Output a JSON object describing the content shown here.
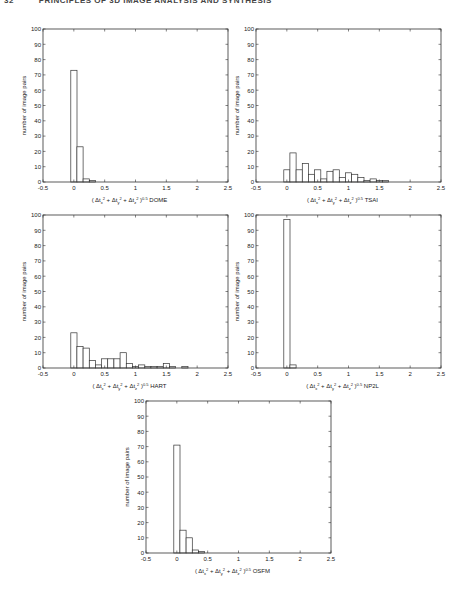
{
  "header": {
    "page_number": "32",
    "running_title": "PRINCIPLES OF 3D IMAGE ANALYSIS AND SYNTHESIS"
  },
  "chart_data": [
    {
      "type": "bar",
      "id": "dome",
      "title": "",
      "xlabel": "( Δt_x² + Δt_y² + Δt_z² )^0.5  DOME",
      "xlabel_parts": {
        "open": "( Δt",
        "x": "x",
        "y": "y",
        "z": "z",
        "close_exp": "0.5",
        "method": "DOME"
      },
      "ylabel": "number of image pairs",
      "xlim": [
        -0.5,
        2.5
      ],
      "ylim": [
        0,
        100
      ],
      "xticks": [
        "-0.5",
        "0",
        "0.5",
        "1",
        "1.5",
        "2",
        "2.5"
      ],
      "yticks": [
        "0",
        "10",
        "20",
        "30",
        "40",
        "50",
        "60",
        "70",
        "80",
        "90",
        "100"
      ],
      "bin_width": 0.1,
      "bin_centers": [
        0,
        0.1,
        0.2,
        0.3
      ],
      "values": [
        73,
        23,
        2,
        1
      ],
      "box": {
        "x": 43,
        "y": 29,
        "w": 185,
        "h": 153
      }
    },
    {
      "type": "bar",
      "id": "tsai",
      "title": "",
      "xlabel": "( Δt_x² + Δt_y² + Δt_z² )^0.5  TSAI",
      "xlabel_parts": {
        "method": "TSAI"
      },
      "ylabel": "number of image pairs",
      "xlim": [
        -0.5,
        2.5
      ],
      "ylim": [
        0,
        100
      ],
      "xticks": [
        "-0.5",
        "0",
        "0.5",
        "1",
        "1.5",
        "2",
        "2.5"
      ],
      "yticks": [
        "0",
        "10",
        "20",
        "30",
        "40",
        "50",
        "60",
        "70",
        "80",
        "90",
        "100"
      ],
      "bin_width": 0.1,
      "bin_centers": [
        0,
        0.1,
        0.2,
        0.3,
        0.4,
        0.5,
        0.6,
        0.7,
        0.8,
        0.9,
        1.0,
        1.1,
        1.2,
        1.3,
        1.4,
        1.5,
        1.6
      ],
      "values": [
        8,
        19,
        8,
        12,
        5,
        8,
        2,
        7,
        8,
        3,
        6,
        5,
        3,
        1,
        2,
        1,
        1
      ],
      "box": {
        "x": 256,
        "y": 29,
        "w": 185,
        "h": 153
      }
    },
    {
      "type": "bar",
      "id": "hart",
      "title": "",
      "xlabel": "( Δt_x² + Δt_y² + Δt_z² )^0.5  HART",
      "xlabel_parts": {
        "method": "HART"
      },
      "ylabel": "number of image pairs",
      "xlim": [
        -0.5,
        2.5
      ],
      "ylim": [
        0,
        100
      ],
      "xticks": [
        "-0.5",
        "0",
        "0.5",
        "1",
        "1.5",
        "2",
        "2.5"
      ],
      "yticks": [
        "0",
        "10",
        "20",
        "30",
        "40",
        "50",
        "60",
        "70",
        "80",
        "90",
        "100"
      ],
      "bin_width": 0.1,
      "bin_centers": [
        0,
        0.1,
        0.2,
        0.3,
        0.4,
        0.5,
        0.6,
        0.7,
        0.8,
        0.9,
        1.0,
        1.1,
        1.2,
        1.3,
        1.4,
        1.5,
        1.6,
        1.7,
        1.8
      ],
      "values": [
        23,
        14,
        13,
        5,
        2,
        6,
        6,
        6,
        10,
        3,
        1,
        2,
        1,
        1,
        1,
        3,
        1,
        0,
        1
      ],
      "box": {
        "x": 43,
        "y": 215,
        "w": 185,
        "h": 153
      }
    },
    {
      "type": "bar",
      "id": "np2l",
      "title": "",
      "xlabel": "( Δt_x² + Δt_y² + Δt_z² )^0.5  NP2L",
      "xlabel_parts": {
        "method": "NP2L"
      },
      "ylabel": "number of image pairs",
      "xlim": [
        -0.5,
        2.5
      ],
      "ylim": [
        0,
        100
      ],
      "xticks": [
        "-0.5",
        "0",
        "0.5",
        "1",
        "1.5",
        "2",
        "2.5"
      ],
      "yticks": [
        "0",
        "10",
        "20",
        "30",
        "40",
        "50",
        "60",
        "70",
        "80",
        "90",
        "100"
      ],
      "bin_width": 0.1,
      "bin_centers": [
        0,
        0.1
      ],
      "values": [
        97,
        2
      ],
      "box": {
        "x": 256,
        "y": 215,
        "w": 185,
        "h": 153
      }
    },
    {
      "type": "bar",
      "id": "osfm",
      "title": "",
      "xlabel": "( Δt_x² + Δt_y² + Δt_z² )^0.5  OSFM",
      "xlabel_parts": {
        "method": "OSFM"
      },
      "ylabel": "number of image pairs",
      "xlim": [
        -0.5,
        2.5
      ],
      "ylim": [
        0,
        100
      ],
      "xticks": [
        "-0.5",
        "0",
        "0.5",
        "1",
        "1.5",
        "2",
        "2.5"
      ],
      "yticks": [
        "0",
        "10",
        "20",
        "30",
        "40",
        "50",
        "60",
        "70",
        "80",
        "90",
        "100"
      ],
      "bin_width": 0.1,
      "bin_centers": [
        0,
        0.1,
        0.2,
        0.3,
        0.4
      ],
      "values": [
        71,
        15,
        10,
        2,
        1
      ],
      "box": {
        "x": 146,
        "y": 401,
        "w": 185,
        "h": 152
      }
    }
  ],
  "colors": {
    "axis": "#333333",
    "bar_fill": "#ffffff",
    "bar_stroke": "#333333",
    "text": "#222222"
  }
}
